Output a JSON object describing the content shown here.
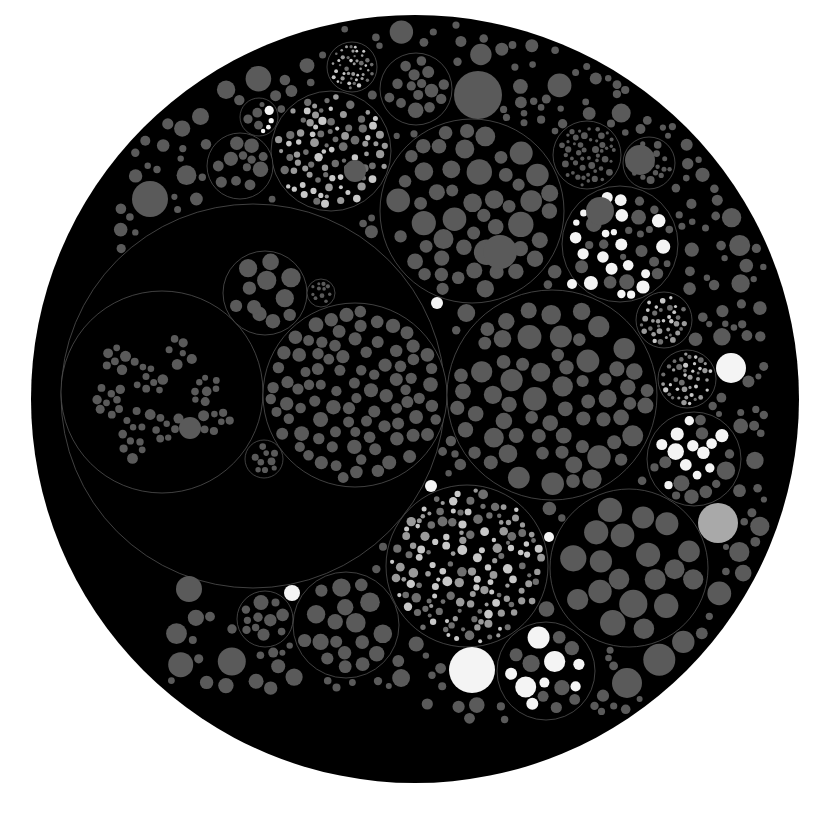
{
  "chart_data": {
    "type": "circle-packing",
    "title": "",
    "canvas": {
      "width": 826,
      "height": 814,
      "background": "#ffffff"
    },
    "colors": {
      "container_fill": "#000000",
      "container_stroke": "#5c5c5c",
      "leaf_gray": "#5a5a5a",
      "leaf_light": "#a9a9a9",
      "leaf_white": "#f4f4f4"
    },
    "root": {
      "cx": 415,
      "cy": 399,
      "r": 384
    },
    "containers": [
      {
        "name": "big-left",
        "cx": 253,
        "cy": 396,
        "r": 192
      },
      {
        "name": "big-left-sub-left",
        "cx": 162,
        "cy": 392,
        "r": 101
      },
      {
        "name": "big-left-sub-right",
        "cx": 355,
        "cy": 395,
        "r": 92
      },
      {
        "name": "big-left-sub-top",
        "cx": 265,
        "cy": 293,
        "r": 42
      },
      {
        "name": "big-left-sub-tiny",
        "cx": 321,
        "cy": 293,
        "r": 14
      },
      {
        "name": "big-left-sub-bottom",
        "cx": 264,
        "cy": 459,
        "r": 19
      },
      {
        "name": "upper-right",
        "cx": 472,
        "cy": 211,
        "r": 92
      },
      {
        "name": "mid-right",
        "cx": 552,
        "cy": 395,
        "r": 105
      },
      {
        "name": "white-blob-right",
        "cx": 620,
        "cy": 244,
        "r": 58
      },
      {
        "name": "bottom-middle",
        "cx": 467,
        "cy": 566,
        "r": 81
      },
      {
        "name": "bottom-right",
        "cx": 629,
        "cy": 568,
        "r": 79
      },
      {
        "name": "white-blob-bottom",
        "cx": 546,
        "cy": 671,
        "r": 49
      },
      {
        "name": "bottom-left",
        "cx": 346,
        "cy": 625,
        "r": 53
      },
      {
        "name": "bottom-left-2",
        "cx": 265,
        "cy": 619,
        "r": 28
      },
      {
        "name": "right-white-clusters",
        "cx": 694,
        "cy": 459,
        "r": 47
      },
      {
        "name": "right-dark-mid",
        "cx": 687,
        "cy": 379,
        "r": 29
      },
      {
        "name": "right-top",
        "cx": 664,
        "cy": 320,
        "r": 28
      },
      {
        "name": "top-fireworks",
        "cx": 331,
        "cy": 151,
        "r": 60
      },
      {
        "name": "top-white-blob",
        "cx": 259,
        "cy": 117,
        "r": 19
      },
      {
        "name": "top-cells",
        "cx": 240,
        "cy": 166,
        "r": 33
      },
      {
        "name": "top-speckled",
        "cx": 352,
        "cy": 67,
        "r": 25
      },
      {
        "name": "top-cells-2",
        "cx": 416,
        "cy": 89,
        "r": 36
      },
      {
        "name": "dense-right",
        "cx": 587,
        "cy": 155,
        "r": 34
      },
      {
        "name": "right-gray-big",
        "cx": 649,
        "cy": 163,
        "r": 26
      }
    ],
    "highlight_leaves": [
      {
        "cx": 472,
        "cy": 670,
        "r": 23,
        "tone": "white"
      },
      {
        "cx": 731,
        "cy": 368,
        "r": 15,
        "tone": "white"
      },
      {
        "cx": 718,
        "cy": 523,
        "r": 20,
        "tone": "light"
      },
      {
        "cx": 437,
        "cy": 303,
        "r": 6,
        "tone": "white"
      },
      {
        "cx": 431,
        "cy": 486,
        "r": 6,
        "tone": "white"
      },
      {
        "cx": 292,
        "cy": 593,
        "r": 8,
        "tone": "white"
      },
      {
        "cx": 572,
        "cy": 284,
        "r": 5,
        "tone": "white"
      },
      {
        "cx": 549,
        "cy": 537,
        "r": 5,
        "tone": "white"
      },
      {
        "cx": 190,
        "cy": 428,
        "r": 11,
        "tone": "gray"
      },
      {
        "cx": 478,
        "cy": 95,
        "r": 24,
        "tone": "gray"
      },
      {
        "cx": 640,
        "cy": 160,
        "r": 15,
        "tone": "gray"
      },
      {
        "cx": 355,
        "cy": 171,
        "r": 11,
        "tone": "gray"
      },
      {
        "cx": 500,
        "cy": 252,
        "r": 17,
        "tone": "gray"
      },
      {
        "cx": 600,
        "cy": 211,
        "r": 14,
        "tone": "gray"
      },
      {
        "cx": 627,
        "cy": 683,
        "r": 15,
        "tone": "gray"
      },
      {
        "cx": 150,
        "cy": 199,
        "r": 18,
        "tone": "gray"
      },
      {
        "cx": 189,
        "cy": 589,
        "r": 13,
        "tone": "gray"
      },
      {
        "cx": 254,
        "cy": 307,
        "r": 7,
        "tone": "gray"
      }
    ],
    "leaf_count_estimate": 2000,
    "legend": [],
    "annotations": []
  }
}
